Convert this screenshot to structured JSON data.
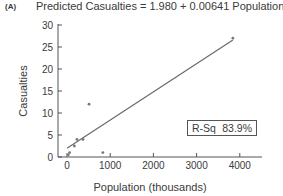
{
  "panel_label": "(A)",
  "chart_data": {
    "type": "scatter",
    "title": "Predicted Casualties = 1.980 + 0.00641 Population (K)",
    "xlabel": "Population (thousands)",
    "ylabel": "Casualties",
    "xlim": [
      0,
      4500
    ],
    "ylim": [
      0,
      30
    ],
    "x_ticks": [
      0,
      1000,
      2000,
      3000,
      4000
    ],
    "y_ticks": [
      0,
      5,
      10,
      15,
      20,
      25,
      30
    ],
    "grid": false,
    "points": [
      {
        "x": 30,
        "y": 0.5
      },
      {
        "x": 60,
        "y": 1
      },
      {
        "x": 170,
        "y": 2.5
      },
      {
        "x": 230,
        "y": 4
      },
      {
        "x": 370,
        "y": 4
      },
      {
        "x": 510,
        "y": 12
      },
      {
        "x": 830,
        "y": 1
      },
      {
        "x": 3840,
        "y": 27
      }
    ],
    "regression": {
      "intercept": 1.98,
      "slope": 0.00641,
      "x_range": [
        0,
        3840
      ]
    },
    "annotation": {
      "label": "R-Sq",
      "value": "83.9%"
    }
  }
}
